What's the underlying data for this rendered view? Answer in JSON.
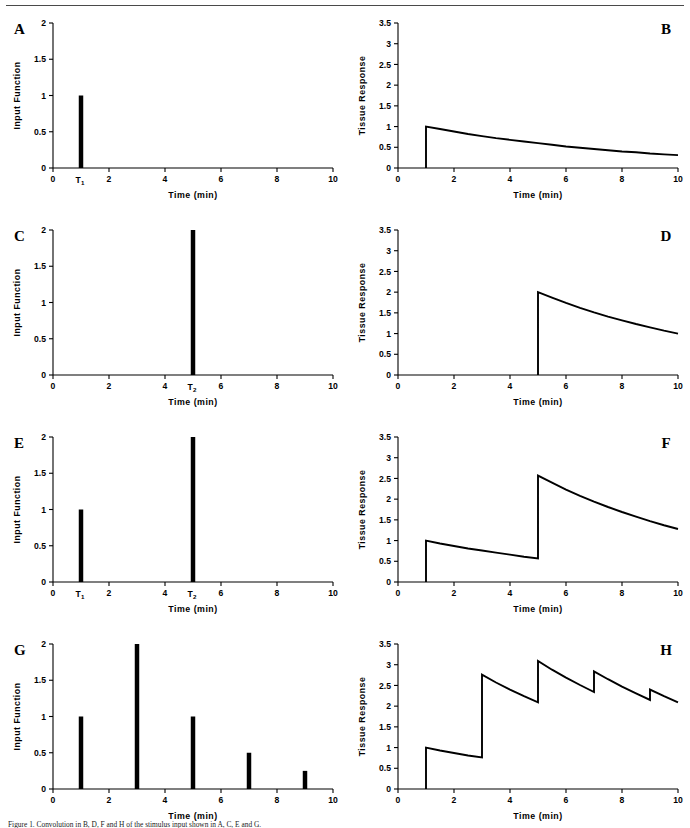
{
  "figure": {
    "top_rule": true,
    "caption": "Figure 1.   Convolution in B, D, F and H of the stimulus input shown in A, C, E and G."
  },
  "axes": {
    "xlabel": "Time  (min)",
    "ylabel_input": "Input Function",
    "ylabel_response": "Tissue Response",
    "x_ticks": [
      0,
      2,
      4,
      6,
      8,
      10
    ],
    "x_tick_labels": [
      "0",
      "2",
      "4",
      "6",
      "8",
      "10"
    ],
    "xlim": [
      0,
      10
    ],
    "y_ticks_input": [
      0,
      0.5,
      1,
      1.5,
      2
    ],
    "y_tick_labels_input": [
      "0",
      "0.5",
      "1",
      "1.5",
      "2"
    ],
    "ylim_input": [
      0,
      2
    ],
    "y_ticks_response": [
      0,
      0.5,
      1,
      1.5,
      2,
      2.5,
      3,
      3.5
    ],
    "y_tick_labels_response": [
      "0",
      "0.5",
      "1",
      "1.5",
      "2",
      "2.5",
      "3",
      "3.5"
    ],
    "ylim_response": [
      0,
      3.5
    ]
  },
  "chart_data": [
    {
      "id": "A",
      "panel_letter": "A",
      "letter_side": "left",
      "type": "bar",
      "title": "",
      "xlabel": "Time  (min)",
      "ylabel": "Input Function",
      "xlim": [
        0,
        10
      ],
      "ylim": [
        0,
        2
      ],
      "grid": false,
      "legend": "none",
      "x": [
        1
      ],
      "values": [
        1
      ],
      "bar_width_min": 0.16,
      "annotations": [
        {
          "text": "T",
          "sub": "1",
          "x": 1,
          "axis": "x"
        }
      ]
    },
    {
      "id": "B",
      "panel_letter": "B",
      "letter_side": "right",
      "type": "line",
      "title": "",
      "xlabel": "Time  (min)",
      "ylabel": "Tissue Response",
      "xlim": [
        0,
        10
      ],
      "ylim": [
        0,
        3.5
      ],
      "grid": false,
      "legend": "none",
      "impulses": [
        {
          "t": 1,
          "amp": 1
        }
      ],
      "decay_rate_per_min": 0.129,
      "series": [
        {
          "name": "response",
          "x": [
            1.0,
            1.0,
            1.5,
            2.0,
            2.5,
            3.0,
            3.5,
            4.0,
            4.5,
            5.0,
            5.5,
            6.0,
            6.5,
            7.0,
            7.5,
            8.0,
            8.5,
            9.0,
            9.5,
            10.0
          ],
          "values": [
            0.0,
            1.0,
            0.94,
            0.88,
            0.82,
            0.77,
            0.72,
            0.68,
            0.64,
            0.6,
            0.56,
            0.52,
            0.49,
            0.46,
            0.43,
            0.4,
            0.38,
            0.35,
            0.33,
            0.31
          ]
        }
      ]
    },
    {
      "id": "C",
      "panel_letter": "C",
      "letter_side": "left",
      "type": "bar",
      "title": "",
      "xlabel": "Time  (min)",
      "ylabel": "Input Function",
      "xlim": [
        0,
        10
      ],
      "ylim": [
        0,
        2
      ],
      "grid": false,
      "legend": "none",
      "x": [
        5
      ],
      "values": [
        2
      ],
      "bar_width_min": 0.16,
      "annotations": [
        {
          "text": "T",
          "sub": "2",
          "x": 5,
          "axis": "x"
        }
      ]
    },
    {
      "id": "D",
      "panel_letter": "D",
      "letter_side": "right",
      "type": "line",
      "title": "",
      "xlabel": "Time  (min)",
      "ylabel": "Tissue Response",
      "xlim": [
        0,
        10
      ],
      "ylim": [
        0,
        3.5
      ],
      "grid": false,
      "legend": "none",
      "impulses": [
        {
          "t": 5,
          "amp": 2
        }
      ],
      "decay_rate_per_min": 0.139,
      "series": [
        {
          "name": "response",
          "x": [
            5.0,
            5.0,
            5.5,
            6.0,
            6.5,
            7.0,
            7.5,
            8.0,
            8.5,
            9.0,
            9.5,
            10.0
          ],
          "values": [
            0.0,
            2.0,
            1.87,
            1.74,
            1.62,
            1.51,
            1.41,
            1.32,
            1.23,
            1.15,
            1.07,
            1.0
          ]
        }
      ]
    },
    {
      "id": "E",
      "panel_letter": "E",
      "letter_side": "left",
      "type": "bar",
      "title": "",
      "xlabel": "Time  (min)",
      "ylabel": "Input Function",
      "xlim": [
        0,
        10
      ],
      "ylim": [
        0,
        2
      ],
      "grid": false,
      "legend": "none",
      "x": [
        1,
        5
      ],
      "values": [
        1,
        2
      ],
      "bar_width_min": 0.16,
      "annotations": [
        {
          "text": "T",
          "sub": "1",
          "x": 1,
          "axis": "x"
        },
        {
          "text": "T",
          "sub": "2",
          "x": 5,
          "axis": "x"
        }
      ]
    },
    {
      "id": "F",
      "panel_letter": "F",
      "letter_side": "right",
      "type": "line",
      "title": "",
      "xlabel": "Time  (min)",
      "ylabel": "Tissue Response",
      "xlim": [
        0,
        10
      ],
      "ylim": [
        0,
        3.5
      ],
      "grid": false,
      "legend": "none",
      "impulses": [
        {
          "t": 1,
          "amp": 1
        },
        {
          "t": 5,
          "amp": 2
        }
      ],
      "decay_rate_per_min": 0.139,
      "series": [
        {
          "name": "response",
          "x": [
            1.0,
            1.0,
            1.5,
            2.0,
            2.5,
            3.0,
            3.5,
            4.0,
            4.5,
            5.0,
            5.0,
            5.5,
            6.0,
            6.5,
            7.0,
            7.5,
            8.0,
            8.5,
            9.0,
            9.5,
            10.0
          ],
          "values": [
            0.0,
            1.0,
            0.93,
            0.87,
            0.81,
            0.76,
            0.71,
            0.66,
            0.61,
            0.57,
            2.57,
            2.4,
            2.23,
            2.08,
            1.94,
            1.81,
            1.69,
            1.58,
            1.47,
            1.37,
            1.28
          ]
        }
      ]
    },
    {
      "id": "G",
      "panel_letter": "G",
      "letter_side": "left",
      "type": "bar",
      "title": "",
      "xlabel": "Time  (min)",
      "ylabel": "Input Function",
      "xlim": [
        0,
        10
      ],
      "ylim": [
        0,
        2
      ],
      "grid": false,
      "legend": "none",
      "x": [
        1,
        3,
        5,
        7,
        9
      ],
      "values": [
        1,
        2,
        1,
        0.5,
        0.25
      ],
      "bar_width_min": 0.16,
      "annotations": []
    },
    {
      "id": "H",
      "panel_letter": "H",
      "letter_side": "right",
      "type": "line",
      "title": "",
      "xlabel": "Time  (min)",
      "ylabel": "Tissue Response",
      "xlim": [
        0,
        10
      ],
      "ylim": [
        0,
        3.5
      ],
      "grid": false,
      "legend": "none",
      "impulses": [
        {
          "t": 1,
          "amp": 1
        },
        {
          "t": 3,
          "amp": 2
        },
        {
          "t": 5,
          "amp": 1
        },
        {
          "t": 7,
          "amp": 0.5
        },
        {
          "t": 9,
          "amp": 0.25
        }
      ],
      "decay_rate_per_min": 0.139,
      "peaks": [
        1.0,
        2.73,
        3.06,
        2.81,
        2.36
      ],
      "troughs": [
        0.76,
        2.08,
        2.33,
        2.13,
        2.06
      ],
      "series": [
        {
          "name": "response",
          "x": [
            1.0,
            1.0,
            1.5,
            2.0,
            2.5,
            3.0,
            3.0,
            3.5,
            4.0,
            4.5,
            5.0,
            5.0,
            5.5,
            6.0,
            6.5,
            7.0,
            7.0,
            7.5,
            8.0,
            8.5,
            9.0,
            9.0,
            9.5,
            10.0
          ],
          "values": [
            0.0,
            1.0,
            0.93,
            0.87,
            0.81,
            0.76,
            2.76,
            2.57,
            2.4,
            2.24,
            2.09,
            3.09,
            2.88,
            2.69,
            2.51,
            2.34,
            2.84,
            2.65,
            2.47,
            2.31,
            2.15,
            2.4,
            2.24,
            2.09
          ]
        }
      ]
    }
  ]
}
